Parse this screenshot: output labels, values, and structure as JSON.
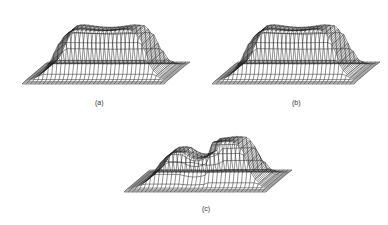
{
  "figure": {
    "panels": [
      {
        "id": "a",
        "label": "(a)",
        "description": "3D wireframe mesh surface: flat-topped dome (plateau) on square base"
      },
      {
        "id": "b",
        "label": "(b)",
        "description": "3D wireframe mesh surface: flat-topped dome (plateau) on square base, similar to (a)"
      },
      {
        "id": "c",
        "label": "(c)",
        "description": "3D wireframe mesh surface: broader dome with a step discontinuity/fold in the middle"
      }
    ],
    "colors": {
      "line": "#222222",
      "background": "#ffffff"
    }
  }
}
